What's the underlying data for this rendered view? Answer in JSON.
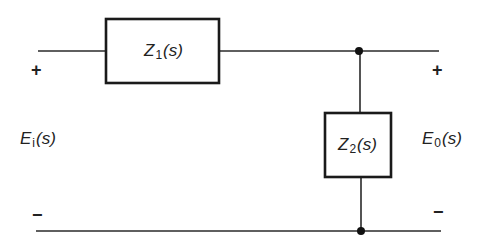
{
  "diagram": {
    "type": "circuit",
    "components": [
      {
        "id": "Z1",
        "label_main": "Z",
        "label_sub": "1",
        "label_arg": "(s)",
        "orientation": "series"
      },
      {
        "id": "Z2",
        "label_main": "Z",
        "label_sub": "2",
        "label_arg": "(s)",
        "orientation": "shunt"
      }
    ],
    "input": {
      "label_main": "E",
      "label_sub": "i",
      "label_arg": "(s)",
      "plus": "+",
      "minus": "−"
    },
    "output": {
      "label_main": "E",
      "label_sub": "0",
      "label_arg": "(s)",
      "plus": "+",
      "minus": "−"
    },
    "nodes": [
      "top-junction",
      "bottom-junction"
    ],
    "colors": {
      "line": "#2a2a2a",
      "background": "#ffffff"
    }
  }
}
